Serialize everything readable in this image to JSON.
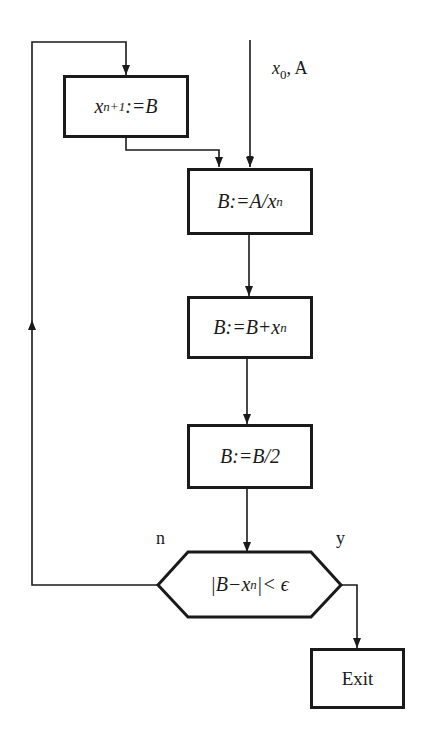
{
  "diagram": {
    "type": "flowchart",
    "title": "",
    "input_label": {
      "var": "x",
      "sub": "0",
      "rest": ", A"
    },
    "nodes": [
      {
        "id": "update",
        "shape": "rect",
        "pre": "x",
        "sub": "n+1",
        "post": ":=B"
      },
      {
        "id": "divide",
        "shape": "rect",
        "pre": "B:=A/x",
        "sub": "n",
        "post": ""
      },
      {
        "id": "add",
        "shape": "rect",
        "pre": "B:=B+x",
        "sub": "n",
        "post": ""
      },
      {
        "id": "halve",
        "shape": "rect",
        "pre": "B:=B/2",
        "sub": "",
        "post": ""
      },
      {
        "id": "test",
        "shape": "hexagon",
        "pre": "|B−x",
        "sub": "n",
        "post": "|< ϵ"
      },
      {
        "id": "exit",
        "shape": "rect",
        "text": "Exit"
      }
    ],
    "branch_labels": {
      "no": "n",
      "yes": "y"
    },
    "edges": [
      {
        "from": "input",
        "to": "divide"
      },
      {
        "from": "update",
        "to": "divide"
      },
      {
        "from": "divide",
        "to": "add"
      },
      {
        "from": "add",
        "to": "halve"
      },
      {
        "from": "halve",
        "to": "test"
      },
      {
        "from": "test",
        "to": "update",
        "label": "n"
      },
      {
        "from": "test",
        "to": "exit",
        "label": "y"
      }
    ],
    "colors": {
      "stroke": "#1a1a1a",
      "background": "#ffffff"
    }
  }
}
